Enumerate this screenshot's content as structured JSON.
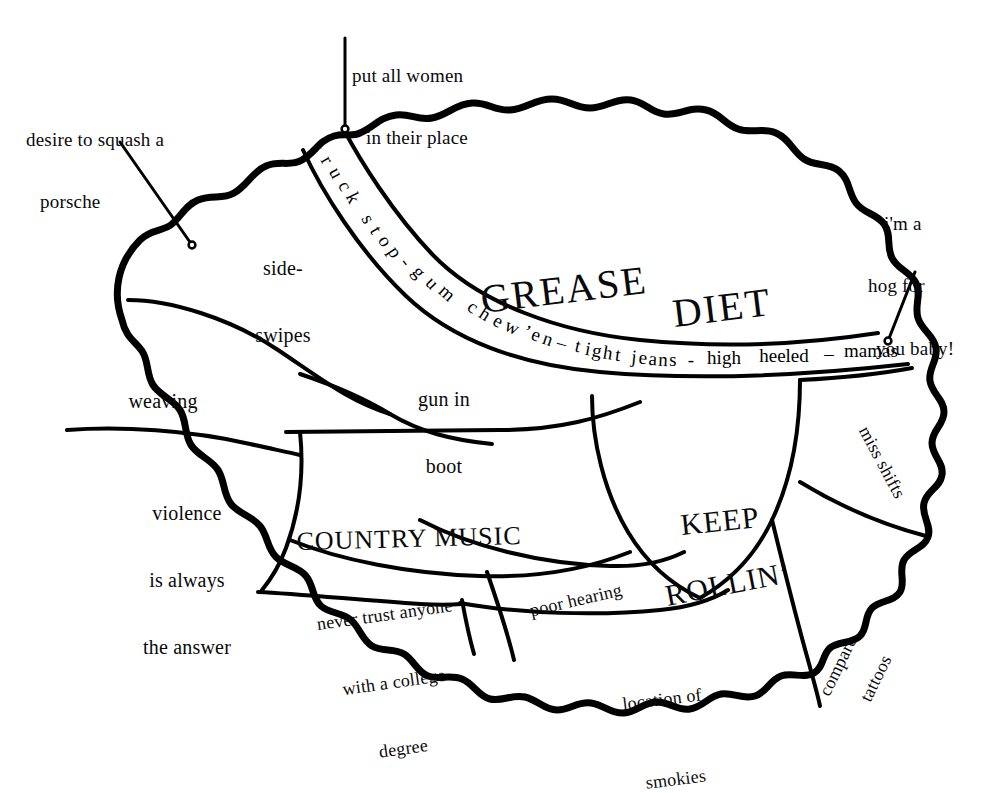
{
  "image": {
    "title": "Redneck / trucker brain phrenology diagram",
    "background_color": "#ffffff",
    "ink_color": "#000000",
    "width": 1006,
    "height": 777
  },
  "annotations": [
    {
      "id": "desire-to-squash-a-porsche",
      "line1": "desire to squash a",
      "line2": "porsche"
    },
    {
      "id": "put-all-women-in-their-place",
      "line1": "put all women",
      "line2": "in their place"
    },
    {
      "id": "im-a-hog-for-you-baby",
      "line1": "i'm a",
      "line2": "hog for",
      "line3": "you baby!"
    }
  ],
  "regions": [
    {
      "id": "side-swipes",
      "line1": "side-",
      "line2": "swipes"
    },
    {
      "id": "weaving",
      "line1": "weaving"
    },
    {
      "id": "gun-in-boot",
      "line1": "gun in",
      "line2": "boot"
    },
    {
      "id": "violence",
      "line1": "violence",
      "line2": "is always",
      "line3": "the answer"
    },
    {
      "id": "country-music",
      "line1": "COUNTRY MUSIC"
    },
    {
      "id": "grease-diet",
      "line1": "GREASE",
      "line2": "DIET"
    },
    {
      "id": "keep-rollin",
      "line1": "KEEP",
      "line2": "ROLLIN’"
    },
    {
      "id": "miss-shifts",
      "line1": "miss shifts"
    },
    {
      "id": "poor-hearing",
      "line1": "poor hearing"
    },
    {
      "id": "never-trust",
      "line1": "never trust anyone",
      "line2": "with a college",
      "line3": "degree"
    },
    {
      "id": "location-of-smokies",
      "line1": "location of",
      "line2": "smokies"
    },
    {
      "id": "compare-tattoos",
      "line1": "compare",
      "line2": "tattoos"
    }
  ],
  "band": {
    "id": "truck-stop-band",
    "full_text": "truck stop - gum chew'en - tight jeans - high heeled - mamas",
    "words": [
      {
        "t": "t",
        "x": 318,
        "y": 148,
        "r": 58
      },
      {
        "t": "r",
        "x": 327,
        "y": 160,
        "r": 60
      },
      {
        "t": "u",
        "x": 336,
        "y": 173,
        "r": 62
      },
      {
        "t": "c",
        "x": 345,
        "y": 186,
        "r": 63
      },
      {
        "t": "k",
        "x": 353,
        "y": 198,
        "r": 64
      },
      {
        "t": " ",
        "x": 360,
        "y": 209,
        "r": 64
      },
      {
        "t": "s",
        "x": 368,
        "y": 219,
        "r": 62
      },
      {
        "t": "t",
        "x": 376,
        "y": 230,
        "r": 60
      },
      {
        "t": "o",
        "x": 385,
        "y": 241,
        "r": 58
      },
      {
        "t": "p",
        "x": 395,
        "y": 252,
        "r": 56
      },
      {
        "t": "-",
        "x": 406,
        "y": 262,
        "r": 53
      },
      {
        "t": "g",
        "x": 419,
        "y": 272,
        "r": 50
      },
      {
        "t": "u",
        "x": 432,
        "y": 283,
        "r": 46
      },
      {
        "t": "m",
        "x": 447,
        "y": 293,
        "r": 42
      },
      {
        "t": " ",
        "x": 461,
        "y": 301,
        "r": 38
      },
      {
        "t": "c",
        "x": 473,
        "y": 307,
        "r": 35
      },
      {
        "t": "h",
        "x": 485,
        "y": 314,
        "r": 32
      },
      {
        "t": "e",
        "x": 498,
        "y": 321,
        "r": 29
      },
      {
        "t": "w",
        "x": 512,
        "y": 327,
        "r": 26
      },
      {
        "t": "’",
        "x": 527,
        "y": 332,
        "r": 23
      },
      {
        "t": "e",
        "x": 536,
        "y": 335,
        "r": 21
      },
      {
        "t": "n",
        "x": 548,
        "y": 339,
        "r": 19
      },
      {
        "t": "–",
        "x": 562,
        "y": 343,
        "r": 16
      },
      {
        "t": "t",
        "x": 578,
        "y": 346,
        "r": 13
      },
      {
        "t": "i",
        "x": 588,
        "y": 349,
        "r": 11
      },
      {
        "t": "g",
        "x": 597,
        "y": 351,
        "r": 10
      },
      {
        "t": "h",
        "x": 608,
        "y": 353,
        "r": 9
      },
      {
        "t": "t",
        "x": 618,
        "y": 355,
        "r": 8
      },
      {
        "t": " ",
        "x": 626,
        "y": 356,
        "r": 7
      },
      {
        "t": "j",
        "x": 634,
        "y": 357,
        "r": 6
      },
      {
        "t": "e",
        "x": 643,
        "y": 358,
        "r": 5
      },
      {
        "t": "a",
        "x": 653,
        "y": 359,
        "r": 4
      },
      {
        "t": "n",
        "x": 663,
        "y": 360,
        "r": 3
      },
      {
        "t": "s",
        "x": 673,
        "y": 360,
        "r": 2
      },
      {
        "t": "-",
        "x": 691,
        "y": 360,
        "r": 0
      },
      {
        "t": "high",
        "x": 724,
        "y": 358,
        "r": 0
      },
      {
        "t": "heeled",
        "x": 784,
        "y": 356,
        "r": 0
      },
      {
        "t": "–",
        "x": 829,
        "y": 354,
        "r": 0
      },
      {
        "t": "mamas",
        "x": 871,
        "y": 351,
        "r": 0
      }
    ]
  },
  "leader_dots": [
    {
      "id": "porsche-dot",
      "cx": 192,
      "cy": 245
    },
    {
      "id": "women-dot",
      "cx": 345,
      "cy": 129
    },
    {
      "id": "hog-dot",
      "cx": 888,
      "cy": 341
    }
  ]
}
